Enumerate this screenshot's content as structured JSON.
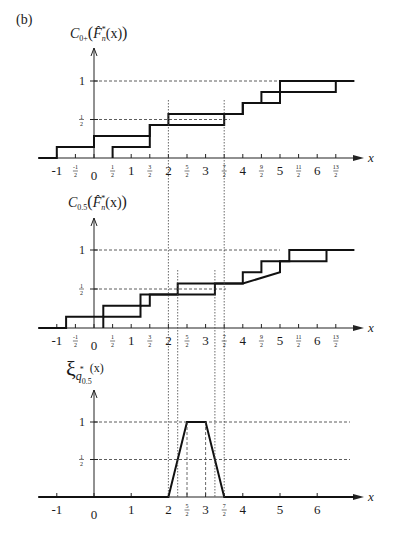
{
  "panel_label": "(b)",
  "chart_data": [
    {
      "type": "line",
      "title": "C_{0+}(F̂*_n(x))",
      "ylabel": "C_{0+}(F̂*_n(x))",
      "xlabel": "x",
      "x_ticks": [
        "-1",
        "-1/2",
        "0",
        "1/2",
        "1",
        "3/2",
        "2",
        "5/2",
        "3",
        "7/2",
        "4",
        "9/2",
        "5",
        "11/2",
        "6",
        "13/2"
      ],
      "y_ticks": [
        "1/2",
        "1"
      ],
      "series": [
        {
          "name": "upper step function",
          "points": [
            [
              -1.5,
              0
            ],
            [
              -1,
              0
            ],
            [
              -1,
              0.143
            ],
            [
              0,
              0.143
            ],
            [
              0,
              0.286
            ],
            [
              1.5,
              0.286
            ],
            [
              1.5,
              0.429
            ],
            [
              2,
              0.429
            ],
            [
              2,
              0.571
            ],
            [
              4,
              0.571
            ],
            [
              4,
              0.714
            ],
            [
              4.5,
              0.714
            ],
            [
              4.5,
              0.857
            ],
            [
              5,
              0.857
            ],
            [
              5,
              1
            ],
            [
              7,
              1
            ]
          ]
        },
        {
          "name": "lower step function",
          "points": [
            [
              0.5,
              0
            ],
            [
              0.5,
              0.143
            ],
            [
              1.5,
              0.143
            ],
            [
              1.5,
              0.429
            ],
            [
              3.5,
              0.429
            ],
            [
              3.5,
              0.571
            ],
            [
              4,
              0.571
            ],
            [
              4,
              0.714
            ],
            [
              5,
              0.714
            ],
            [
              5,
              0.857
            ],
            [
              6.5,
              0.857
            ],
            [
              6.5,
              1
            ]
          ]
        }
      ],
      "reference_lines": {
        "y": [
          0.5,
          1
        ],
        "x": [
          2,
          3.5
        ]
      },
      "ylim": [
        0,
        1.2
      ],
      "xlim": [
        -1.5,
        7
      ]
    },
    {
      "type": "line",
      "title": "C_{0.5}(F̂*_n(x))",
      "ylabel": "C_{0.5}(F̂*_n(x))",
      "xlabel": "x",
      "x_ticks": [
        "-1",
        "-1/2",
        "0",
        "1/2",
        "1",
        "3/2",
        "2",
        "5/2",
        "3",
        "7/2",
        "4",
        "9/2",
        "5",
        "11/2",
        "6",
        "13/2"
      ],
      "y_ticks": [
        "1/2",
        "1"
      ],
      "series": [
        {
          "name": "upper step function",
          "points": [
            [
              -1.5,
              0
            ],
            [
              -0.75,
              0
            ],
            [
              -0.75,
              0.143
            ],
            [
              0.25,
              0.143
            ],
            [
              0.25,
              0.286
            ],
            [
              1.25,
              0.286
            ],
            [
              1.25,
              0.429
            ],
            [
              2.25,
              0.429
            ],
            [
              2.25,
              0.571
            ],
            [
              3.25,
              0.571
            ],
            [
              3.25,
              0.571
            ],
            [
              4,
              0.571
            ],
            [
              4,
              0.714
            ],
            [
              4.5,
              0.714
            ],
            [
              4.5,
              0.857
            ],
            [
              5.25,
              0.857
            ],
            [
              5.25,
              1
            ],
            [
              7,
              1
            ]
          ]
        },
        {
          "name": "lower step function",
          "points": [
            [
              0.25,
              0
            ],
            [
              0.25,
              0.143
            ],
            [
              1.25,
              0.143
            ],
            [
              1.25,
              0.286
            ],
            [
              1.5,
              0.286
            ],
            [
              1.5,
              0.429
            ],
            [
              3.25,
              0.429
            ],
            [
              3.25,
              0.571
            ],
            [
              4,
              0.571
            ],
            [
              5,
              0.714
            ],
            [
              5,
              0.857
            ],
            [
              6.25,
              0.857
            ],
            [
              6.25,
              1
            ]
          ]
        }
      ],
      "reference_lines": {
        "y": [
          0.5,
          1
        ],
        "x": [
          2,
          2.25,
          3.25,
          3.5
        ]
      },
      "ylim": [
        0,
        1.2
      ],
      "xlim": [
        -1.5,
        7
      ]
    },
    {
      "type": "line",
      "title": "ξ_{q*_{0.5}}(x)",
      "ylabel": "ξ_{q*_{0.5}}(x)",
      "xlabel": "x",
      "x_ticks": [
        "-1",
        "0",
        "1",
        "2",
        "5/2",
        "3",
        "7/2",
        "4",
        "5",
        "6"
      ],
      "y_ticks": [
        "1/2",
        "1"
      ],
      "series": [
        {
          "name": "membership function",
          "points": [
            [
              -1.5,
              0
            ],
            [
              2,
              0
            ],
            [
              2.5,
              1
            ],
            [
              3,
              1
            ],
            [
              3.5,
              0
            ],
            [
              7,
              0
            ]
          ]
        }
      ],
      "reference_lines": {
        "y": [
          0.5,
          1
        ],
        "x": [
          2,
          2.25,
          2.5,
          3,
          3.25,
          3.5
        ]
      },
      "ylim": [
        0,
        1.2
      ],
      "xlim": [
        -1.5,
        7
      ]
    }
  ],
  "labels": {
    "c1_title_main": "C",
    "c1_title_sub": "0+",
    "c2_title_sub": "0.5",
    "f_hat": "F̂",
    "f_sup": "*",
    "f_sub": "n",
    "paren_x": "(x)",
    "xi": "ξ",
    "xi_sub": "q",
    "xi_subsub": "0.5",
    "xi_sup": "*",
    "x_axis": "x",
    "y_one": "1",
    "y_half_num": "1",
    "y_half_den": "2"
  }
}
